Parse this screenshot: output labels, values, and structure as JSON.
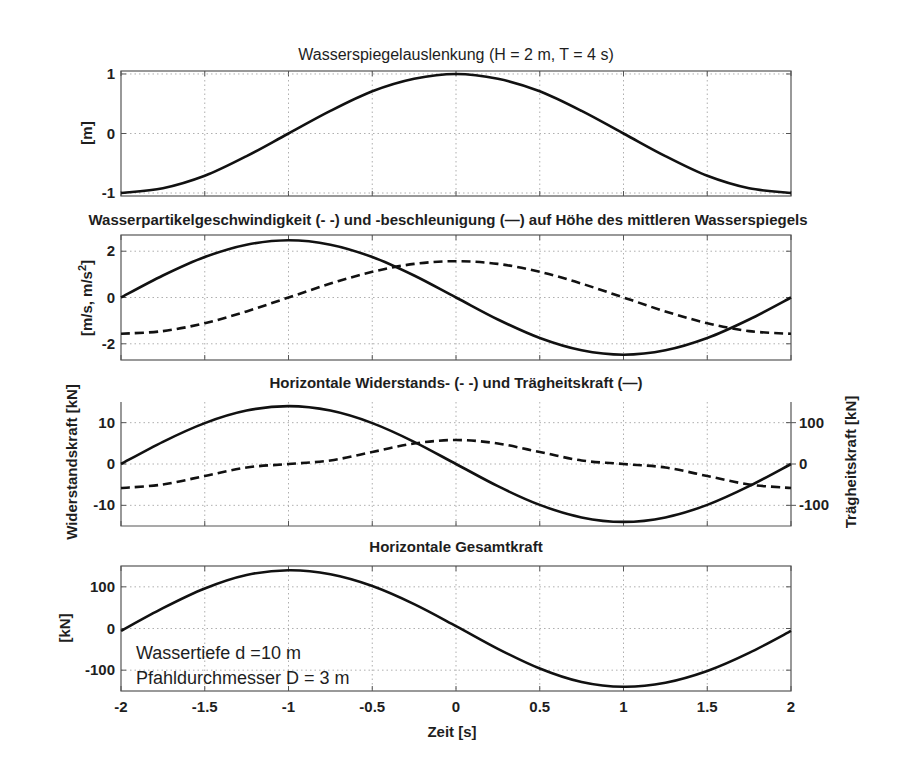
{
  "figure": {
    "xlabel": "Zeit [s]",
    "annotation_lines": [
      "Wassertiefe d =10 m",
      "Pfahldurchmesser  D = 3 m"
    ]
  },
  "chart_data": [
    {
      "type": "line",
      "title": "Wasserspiegelauslenkung (H = 2 m, T = 4 s)",
      "xlabel": "",
      "ylabel": "[m]",
      "xlim": [
        -2,
        2
      ],
      "ylim": [
        -1.05,
        1.05
      ],
      "xticks": [
        -2,
        -1.5,
        -1,
        -0.5,
        0,
        0.5,
        1,
        1.5,
        2
      ],
      "yticks": [
        -1,
        0,
        1
      ],
      "ytick_labels": [
        "-1",
        "0",
        "1"
      ],
      "grid": true,
      "x": [
        -2,
        -1.75,
        -1.5,
        -1.25,
        -1,
        -0.75,
        -0.5,
        -0.25,
        0,
        0.25,
        0.5,
        0.75,
        1,
        1.25,
        1.5,
        1.75,
        2
      ],
      "series": [
        {
          "name": "Wasserspiegelauslenkung",
          "style": "solid",
          "values": [
            -1,
            -0.92,
            -0.71,
            -0.38,
            0,
            0.38,
            0.71,
            0.92,
            1,
            0.92,
            0.71,
            0.38,
            0,
            -0.38,
            -0.71,
            -0.92,
            -1
          ]
        }
      ]
    },
    {
      "type": "line",
      "title": "Wasserpartikelgeschwindigkeit (- -) und -beschleunigung (—) auf Höhe des mittleren Wasserspiegels",
      "xlabel": "",
      "ylabel": "[m/s, m/s²]",
      "xlim": [
        -2,
        2
      ],
      "ylim": [
        -2.7,
        2.7
      ],
      "xticks": [
        -2,
        -1.5,
        -1,
        -0.5,
        0,
        0.5,
        1,
        1.5,
        2
      ],
      "yticks": [
        -2,
        0,
        2
      ],
      "ytick_labels": [
        "-2",
        "0",
        "2"
      ],
      "grid": true,
      "x": [
        -2,
        -1.75,
        -1.5,
        -1.25,
        -1,
        -0.75,
        -0.5,
        -0.25,
        0,
        0.25,
        0.5,
        0.75,
        1,
        1.25,
        1.5,
        1.75,
        2
      ],
      "series": [
        {
          "name": "Geschwindigkeit (- -)",
          "style": "dashed",
          "values": [
            -1.57,
            -1.45,
            -1.11,
            -0.6,
            0,
            0.6,
            1.11,
            1.45,
            1.57,
            1.45,
            1.11,
            0.6,
            0,
            -0.6,
            -1.11,
            -1.45,
            -1.57
          ]
        },
        {
          "name": "Beschleunigung (—)",
          "style": "solid",
          "values": [
            0,
            0.95,
            1.75,
            2.28,
            2.47,
            2.28,
            1.75,
            0.95,
            0,
            -0.95,
            -1.75,
            -2.28,
            -2.47,
            -2.28,
            -1.75,
            -0.95,
            0
          ]
        }
      ]
    },
    {
      "type": "line",
      "title": "Horizontale Widerstands- (- -) und Trägheitskraft (—)",
      "xlabel": "",
      "ylabel": "Widerstandskraft [kN]",
      "ylabel_right": "Trägheitskraft [kN]",
      "xlim": [
        -2,
        2
      ],
      "ylim": [
        -15,
        15
      ],
      "ylim_right": [
        -150,
        150
      ],
      "xticks": [
        -2,
        -1.5,
        -1,
        -0.5,
        0,
        0.5,
        1,
        1.5,
        2
      ],
      "yticks": [
        -10,
        0,
        10
      ],
      "ytick_labels": [
        "-10",
        "0",
        "10"
      ],
      "yticks_right": [
        -100,
        0,
        100
      ],
      "ytick_labels_right": [
        "-100",
        "0",
        "100"
      ],
      "grid": true,
      "x": [
        -2,
        -1.75,
        -1.5,
        -1.25,
        -1,
        -0.75,
        -0.5,
        -0.25,
        0,
        0.25,
        0.5,
        0.75,
        1,
        1.25,
        1.5,
        1.75,
        2
      ],
      "series": [
        {
          "name": "Widerstandskraft (- -)",
          "axis": "left",
          "style": "dashed",
          "values": [
            -5.8,
            -4.95,
            -2.9,
            -0.85,
            0,
            0.85,
            2.9,
            4.95,
            5.8,
            4.95,
            2.9,
            0.85,
            0,
            -0.85,
            -2.9,
            -4.95,
            -5.8
          ]
        },
        {
          "name": "Trägheitskraft (—)",
          "axis": "right",
          "style": "solid",
          "values": [
            0,
            53.6,
            99,
            129.3,
            140,
            129.3,
            99,
            53.6,
            0,
            -53.6,
            -99,
            -129.3,
            -140,
            -129.3,
            -99,
            -53.6,
            0
          ]
        }
      ]
    },
    {
      "type": "line",
      "title": "Horizontale Gesamtkraft",
      "xlabel": "Zeit [s]",
      "ylabel": "[kN]",
      "xlim": [
        -2,
        2
      ],
      "ylim": [
        -150,
        150
      ],
      "xticks": [
        -2,
        -1.5,
        -1,
        -0.5,
        0,
        0.5,
        1,
        1.5,
        2
      ],
      "xtick_labels": [
        "-2",
        "-1.5",
        "-1",
        "-0.5",
        "0",
        "0.5",
        "1",
        "1.5",
        "2"
      ],
      "yticks": [
        -100,
        0,
        100
      ],
      "ytick_labels": [
        "-100",
        "0",
        "100"
      ],
      "grid": true,
      "x": [
        -2,
        -1.75,
        -1.5,
        -1.25,
        -1,
        -0.75,
        -0.5,
        -0.25,
        0,
        0.25,
        0.5,
        0.75,
        1,
        1.25,
        1.5,
        1.75,
        2
      ],
      "series": [
        {
          "name": "Gesamtkraft",
          "style": "solid",
          "values": [
            -5.8,
            48.7,
            96.1,
            128.5,
            140,
            130.2,
            101.9,
            58.6,
            5.8,
            -48.7,
            -96.1,
            -128.5,
            -140,
            -130.2,
            -101.9,
            -58.6,
            -5.8
          ]
        }
      ]
    }
  ]
}
